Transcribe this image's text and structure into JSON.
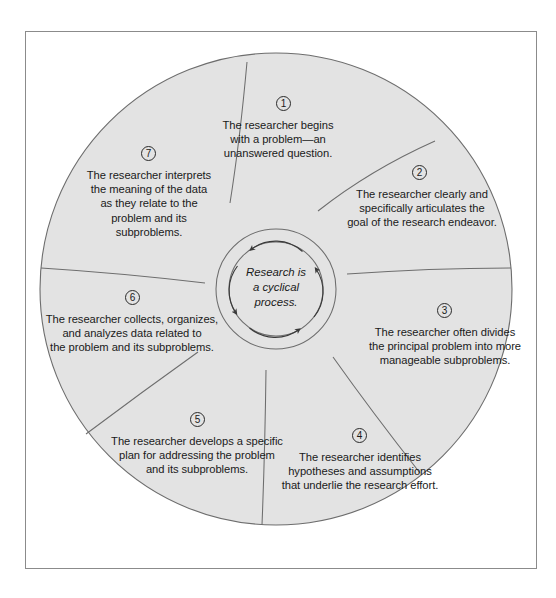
{
  "figure": {
    "title": "Research is a cyclical process",
    "center_label": "Research is\na cyclical\nprocess.",
    "fill_color": "#e3e3e3",
    "stroke_color": "#555555",
    "frame_color": "#8b8b8b",
    "text_color": "#1a1a1a"
  },
  "steps": [
    {
      "number": "1",
      "text": "The researcher begins\nwith a problem—an\nunanswered question."
    },
    {
      "number": "2",
      "text": "The researcher clearly and\nspecifically articulates the\ngoal of the research endeavor."
    },
    {
      "number": "3",
      "text": "The researcher often divides\nthe principal problem into more\nmanageable subproblems."
    },
    {
      "number": "4",
      "text": "The researcher identifies\nhypotheses and assumptions\nthat underlie the research effort."
    },
    {
      "number": "5",
      "text": "The researcher develops a specific\nplan for addressing the problem\nand its subproblems."
    },
    {
      "number": "6",
      "text": "The researcher collects, organizes,\nand analyzes data related to\nthe problem and its subproblems."
    },
    {
      "number": "7",
      "text": "The researcher interprets\nthe meaning of the data\nas they relate to the\nproblem and its\nsubproblems."
    }
  ]
}
